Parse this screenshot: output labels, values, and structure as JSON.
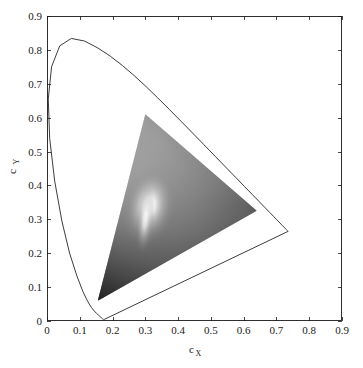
{
  "chart_data": {
    "type": "scatter",
    "title": "",
    "subtitle": "",
    "xlabel": "c_X",
    "ylabel": "c_Y",
    "xlabel_base": "c",
    "xlabel_sub": "X",
    "ylabel_base": "c",
    "ylabel_sub": "Y",
    "xlim": [
      0,
      0.9
    ],
    "ylim": [
      0,
      0.9
    ],
    "xticks": [
      "0",
      "0.1",
      "0.2",
      "0.3",
      "0.4",
      "0.5",
      "0.6",
      "0.7",
      "0.8",
      "0.9"
    ],
    "yticks": [
      "0",
      "0.1",
      "0.2",
      "0.3",
      "0.4",
      "0.5",
      "0.6",
      "0.7",
      "0.8",
      "0.9"
    ],
    "xtick_values": [
      0,
      0.1,
      0.2,
      0.3,
      0.4,
      0.5,
      0.6,
      0.7,
      0.8,
      0.9
    ],
    "ytick_values": [
      0,
      0.1,
      0.2,
      0.3,
      0.4,
      0.5,
      0.6,
      0.7,
      0.8,
      0.9
    ],
    "grid": false,
    "legend": "none",
    "box": true,
    "series": [
      {
        "name": "spectral-locus",
        "kind": "closed-curve",
        "stroke": "#262626",
        "stroke_width": 0.9,
        "fill": "none",
        "points": [
          [
            0.1741,
            0.005
          ],
          [
            0.174,
            0.005
          ],
          [
            0.1738,
            0.0049
          ],
          [
            0.1736,
            0.0049
          ],
          [
            0.1733,
            0.0048
          ],
          [
            0.173,
            0.0048
          ],
          [
            0.1726,
            0.0048
          ],
          [
            0.1721,
            0.0048
          ],
          [
            0.1714,
            0.0051
          ],
          [
            0.1703,
            0.0058
          ],
          [
            0.1689,
            0.0069
          ],
          [
            0.1669,
            0.0086
          ],
          [
            0.1644,
            0.0109
          ],
          [
            0.1611,
            0.0138
          ],
          [
            0.1566,
            0.0177
          ],
          [
            0.151,
            0.0227
          ],
          [
            0.144,
            0.0297
          ],
          [
            0.1355,
            0.0399
          ],
          [
            0.1241,
            0.0578
          ],
          [
            0.1096,
            0.0868
          ],
          [
            0.0913,
            0.1327
          ],
          [
            0.0687,
            0.2007
          ],
          [
            0.0454,
            0.295
          ],
          [
            0.0235,
            0.4127
          ],
          [
            0.0082,
            0.5384
          ],
          [
            0.0039,
            0.6548
          ],
          [
            0.0139,
            0.7502
          ],
          [
            0.0389,
            0.812
          ],
          [
            0.0743,
            0.8338
          ],
          [
            0.1142,
            0.8262
          ],
          [
            0.1547,
            0.8059
          ],
          [
            0.1929,
            0.7816
          ],
          [
            0.2296,
            0.7543
          ],
          [
            0.2658,
            0.7243
          ],
          [
            0.3016,
            0.6923
          ],
          [
            0.3373,
            0.6589
          ],
          [
            0.3731,
            0.6245
          ],
          [
            0.4087,
            0.5896
          ],
          [
            0.4441,
            0.5547
          ],
          [
            0.4788,
            0.5202
          ],
          [
            0.5125,
            0.4866
          ],
          [
            0.5448,
            0.4544
          ],
          [
            0.5752,
            0.4242
          ],
          [
            0.6029,
            0.3965
          ],
          [
            0.627,
            0.3725
          ],
          [
            0.6482,
            0.3514
          ],
          [
            0.6658,
            0.334
          ],
          [
            0.6801,
            0.3197
          ],
          [
            0.6915,
            0.3083
          ],
          [
            0.7006,
            0.2993
          ],
          [
            0.7079,
            0.292
          ],
          [
            0.714,
            0.2859
          ],
          [
            0.719,
            0.2809
          ],
          [
            0.723,
            0.277
          ],
          [
            0.726,
            0.274
          ],
          [
            0.7283,
            0.2717
          ],
          [
            0.73,
            0.27
          ],
          [
            0.7311,
            0.2689
          ],
          [
            0.732,
            0.268
          ],
          [
            0.7327,
            0.2673
          ],
          [
            0.7334,
            0.2666
          ],
          [
            0.734,
            0.266
          ],
          [
            0.7344,
            0.2656
          ],
          [
            0.7346,
            0.2654
          ],
          [
            0.7347,
            0.2653
          ]
        ],
        "closing_line_name": "line-of-purples"
      },
      {
        "name": "gamut-triangle",
        "kind": "filled-polygon",
        "fill_style": "grayscale-gradient",
        "vertices": [
          {
            "name": "green-primary",
            "cx": 0.3,
            "cy": 0.61
          },
          {
            "name": "red-primary",
            "cx": 0.64,
            "cy": 0.325
          },
          {
            "name": "blue-primary",
            "cx": 0.155,
            "cy": 0.06
          }
        ],
        "white_point": {
          "name": "white-point",
          "cx": 0.312,
          "cy": 0.34
        },
        "gradient_stops": [
          "#ffffff",
          "#8f8f8f",
          "#4a4a4a",
          "#2e2e2e"
        ]
      }
    ],
    "colors": {
      "background": "#ffffff",
      "axis": "#1a1a1a",
      "curve": "#262626",
      "tick_text": "#1a1a1a"
    }
  },
  "plot_box": {
    "left_px": 47,
    "right_px": 342,
    "top_px": 16,
    "bottom_px": 321
  }
}
